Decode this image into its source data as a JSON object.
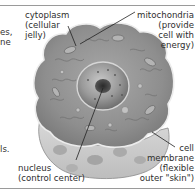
{
  "diagram": {
    "labels": {
      "cytoplasm": [
        "cytoplasm",
        "(cellular",
        "jelly)"
      ],
      "mitochondria": [
        "mitochondria",
        "(provide",
        "cell with",
        "energy)"
      ],
      "nucleus": [
        "nucleus",
        "(control center)"
      ],
      "membrane": [
        "cell",
        "membrane",
        "(flexible",
        "outer \"skin\")"
      ]
    },
    "left_fragments": [
      "es,",
      "ne",
      "ls."
    ]
  }
}
